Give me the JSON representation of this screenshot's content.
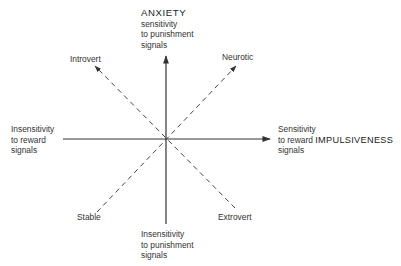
{
  "diagram": {
    "center": {
      "x": 166,
      "y": 139
    },
    "axes": {
      "vertical": {
        "top_label": {
          "title": "ANXIETY",
          "line1": "sensitivity",
          "line2": "to punishment",
          "line3": "signals"
        },
        "bottom_label": {
          "line1": "Insensitivity",
          "line2": "to punishment",
          "line3": "signals"
        }
      },
      "horizontal": {
        "left_label": {
          "line1": "Insensitivity",
          "line2": "to reward",
          "line3": "signals"
        },
        "right_label": {
          "line1": "Sensitivity",
          "line2": "to reward",
          "title": "IMPULSIVENESS",
          "line3": "signals"
        }
      }
    },
    "diagonals": {
      "upper_left": "Introvert",
      "upper_right": "Neurotic",
      "lower_left": "Stable",
      "lower_right": "Extrovert"
    },
    "colors": {
      "line": "#333333",
      "background": "#ffffff"
    }
  }
}
